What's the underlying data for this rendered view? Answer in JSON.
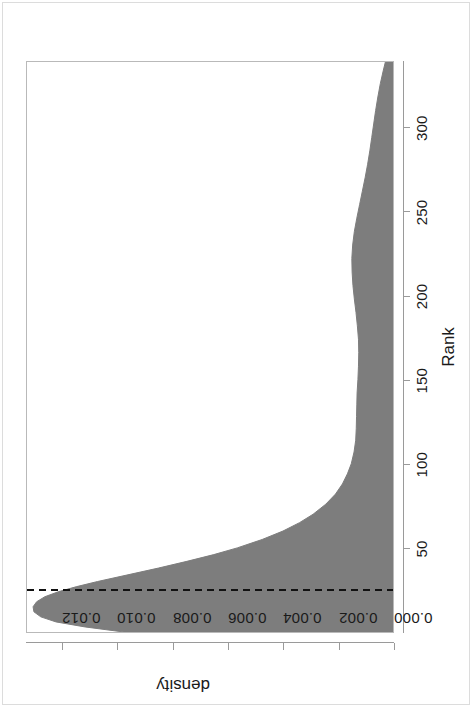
{
  "figure": {
    "device": {
      "width": 708,
      "height": 473
    },
    "page_rotation_deg": -90,
    "frame_color": "#dcdcdc",
    "box_color": "#b9b9b9"
  },
  "chart_data": {
    "type": "area",
    "title": "",
    "subtitle": "",
    "xlabel": "Rank",
    "ylabel": "density",
    "xlim": [
      0,
      340
    ],
    "ylim": [
      0,
      0.0133
    ],
    "grid": false,
    "legend": null,
    "fill_color": "#7d7d7d",
    "line_color": "#7d7d7d",
    "xticks": [
      50,
      100,
      150,
      200,
      250,
      300
    ],
    "xtick_labels": [
      "50",
      "100",
      "150",
      "200",
      "250",
      "300"
    ],
    "yticks": [
      0.0,
      0.002,
      0.004,
      0.006,
      0.008,
      0.01,
      0.012
    ],
    "ytick_labels": [
      "0.000",
      "0.002",
      "0.004",
      "0.006",
      "0.008",
      "0.010",
      "0.012"
    ],
    "annotations": [
      {
        "kind": "vline",
        "name": "reference-line",
        "x": 25,
        "style": "dashed",
        "color": "#111111",
        "width": 2
      }
    ],
    "x": [
      0,
      3,
      6,
      9,
      12,
      15,
      18,
      21,
      24,
      27,
      30,
      34,
      38,
      42,
      46,
      50,
      55,
      60,
      65,
      70,
      76,
      82,
      88,
      94,
      100,
      107,
      114,
      121,
      128,
      135,
      142,
      150,
      158,
      166,
      174,
      182,
      190,
      198,
      206,
      214,
      222,
      230,
      238,
      246,
      254,
      262,
      270,
      278,
      286,
      294,
      302,
      310,
      318,
      326,
      334,
      340
    ],
    "y": [
      0.0098,
      0.0112,
      0.01225,
      0.0128,
      0.01305,
      0.01308,
      0.01295,
      0.01265,
      0.01215,
      0.0115,
      0.01075,
      0.00965,
      0.00855,
      0.00752,
      0.00655,
      0.0057,
      0.0048,
      0.00405,
      0.00345,
      0.00296,
      0.0025,
      0.00215,
      0.0019,
      0.00172,
      0.00158,
      0.00148,
      0.00142,
      0.0014,
      0.00139,
      0.00138,
      0.00137,
      0.00134,
      0.00132,
      0.00131,
      0.00132,
      0.00136,
      0.00141,
      0.00147,
      0.00152,
      0.00155,
      0.00156,
      0.00153,
      0.00147,
      0.00138,
      0.00128,
      0.00118,
      0.00108,
      0.00099,
      0.00091,
      0.00084,
      0.00077,
      0.0007,
      0.00062,
      0.00053,
      0.00042,
      0.00033
    ]
  }
}
